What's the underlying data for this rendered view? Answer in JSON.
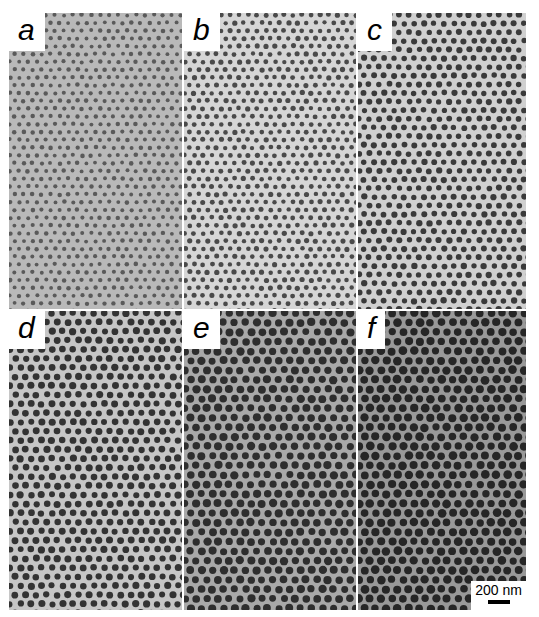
{
  "figure": {
    "panels": [
      {
        "label": "a",
        "bg": "#b9b9b9",
        "pore": "#5a5a5a",
        "spacing": 9,
        "r": 2.1
      },
      {
        "label": "b",
        "bg": "#d6d6d6",
        "pore": "#4a4a4a",
        "spacing": 9,
        "r": 2.4
      },
      {
        "label": "c",
        "bg": "#d0d0d0",
        "pore": "#3a3a3a",
        "spacing": 10,
        "r": 2.9
      },
      {
        "label": "d",
        "bg": "#c6c6c6",
        "pore": "#333333",
        "spacing": 10.5,
        "r": 3.3
      },
      {
        "label": "e",
        "bg": "#a9a9a9",
        "pore": "#2e2e2e",
        "spacing": 11,
        "r": 3.8
      },
      {
        "label": "f",
        "bg": "#999999",
        "pore": "#262626",
        "spacing": 11,
        "r": 4.0
      }
    ],
    "scale_bar": {
      "text": "200 nm"
    }
  }
}
